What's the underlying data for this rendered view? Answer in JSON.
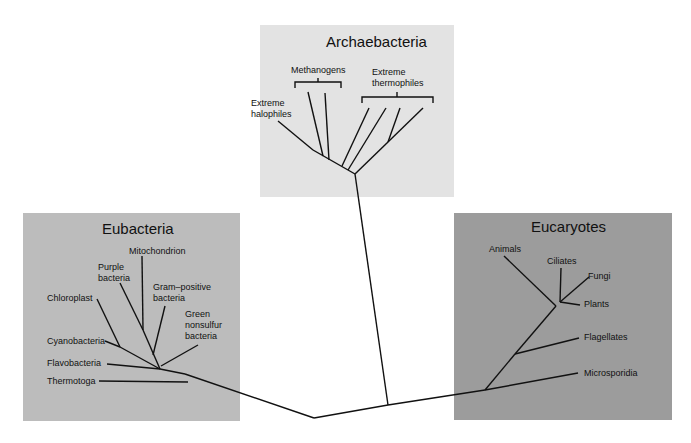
{
  "diagram": {
    "type": "phylogenetic-tree",
    "groups": [
      {
        "name": "Archaebacteria",
        "color": "#e3e3e3",
        "taxa": [
          "Extreme halophiles",
          "Methanogens",
          "Extreme thermophiles"
        ]
      },
      {
        "name": "Eubacteria",
        "color": "#bcbcbc",
        "taxa": [
          "Mitochondrion",
          "Purple bacteria",
          "Gram–positive bacteria",
          "Chloroplast",
          "Green nonsulfur bacteria",
          "Cyanobacteria",
          "Flavobacteria",
          "Thermotoga"
        ]
      },
      {
        "name": "Eucaryotes",
        "color": "#9c9c9c",
        "taxa": [
          "Animals",
          "Ciliates",
          "Fungi",
          "Plants",
          "Flagellates",
          "Microsporidia"
        ]
      }
    ]
  },
  "archaebacteria": {
    "title": "Archaebacteria",
    "labels": {
      "methanogens": "Methanogens",
      "extreme_thermophiles_1": "Extreme",
      "extreme_thermophiles_2": "thermophiles",
      "extreme_halophiles_1": "Extreme",
      "extreme_halophiles_2": "halophiles"
    }
  },
  "eubacteria": {
    "title": "Eubacteria",
    "labels": {
      "mitochondrion": "Mitochondrion",
      "purple_1": "Purple",
      "purple_2": "bacteria",
      "gram_1": "Gram–positive",
      "gram_2": "bacteria",
      "chloroplast": "Chloroplast",
      "green_1": "Green",
      "green_2": "nonsulfur",
      "green_3": "bacteria",
      "cyanobacteria": "Cyanobacteria",
      "flavobacteria": "Flavobacteria",
      "thermotoga": "Thermotoga"
    }
  },
  "eucaryotes": {
    "title": "Eucaryotes",
    "labels": {
      "animals": "Animals",
      "ciliates": "Ciliates",
      "fungi": "Fungi",
      "plants": "Plants",
      "flagellates": "Flagellates",
      "microsporidia": "Microsporidia"
    }
  }
}
